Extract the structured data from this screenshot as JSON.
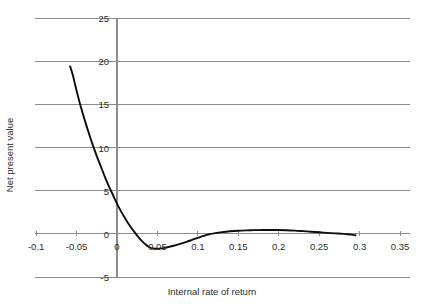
{
  "figure": {
    "top_fragment": "",
    "background": "#ffffff",
    "grid_color": "#8c8c8c",
    "axis_color": "#8c8c8c",
    "curve_color": "#0d0d0d",
    "text_color": "#2b2b2b"
  },
  "chart_data": {
    "type": "line",
    "title": "",
    "subtitle": "",
    "xlabel": "Internal rate of return",
    "ylabel": "Net present value",
    "xlim": [
      -0.1,
      0.35
    ],
    "ylim": [
      -5,
      25
    ],
    "xticks": [
      -0.1,
      -0.05,
      0,
      0.05,
      0.1,
      0.15,
      0.2,
      0.25,
      0.3,
      0.35
    ],
    "xticklabels": [
      "-0.1",
      "-0.05",
      "0",
      "0.05",
      "0.1",
      "0.15",
      "0.2",
      "0.25",
      "0.3",
      "0.35"
    ],
    "yticks": [
      -5,
      0,
      5,
      10,
      15,
      20,
      25
    ],
    "yticklabels": [
      "-5",
      "0",
      "5",
      "10",
      "15",
      "20",
      "25"
    ],
    "grid": "horizontal",
    "legend": null,
    "legend_position": "none",
    "annotations": [],
    "series": [
      {
        "name": "Net present value",
        "color": "#0d0d0d",
        "x": [
          -0.058,
          -0.055,
          -0.05,
          -0.045,
          -0.04,
          -0.035,
          -0.03,
          -0.025,
          -0.02,
          -0.015,
          -0.01,
          -0.005,
          0.0,
          0.005,
          0.01,
          0.015,
          0.02,
          0.025,
          0.03,
          0.035,
          0.04,
          0.045,
          0.05,
          0.055,
          0.06,
          0.065,
          0.07,
          0.075,
          0.08,
          0.085,
          0.09,
          0.095,
          0.1,
          0.105,
          0.11,
          0.115,
          0.12,
          0.13,
          0.14,
          0.15,
          0.16,
          0.17,
          0.18,
          0.19,
          0.2,
          0.21,
          0.22,
          0.23,
          0.24,
          0.25,
          0.26,
          0.27,
          0.28,
          0.285,
          0.29,
          0.295
        ],
        "y": [
          19.4,
          18.5,
          16.6,
          14.8,
          13.2,
          11.7,
          10.3,
          9.0,
          7.8,
          6.6,
          5.5,
          4.5,
          3.5,
          2.6,
          1.8,
          1.05,
          0.4,
          -0.2,
          -0.75,
          -1.2,
          -1.55,
          -1.7,
          -1.72,
          -1.68,
          -1.6,
          -1.5,
          -1.38,
          -1.25,
          -1.1,
          -0.95,
          -0.8,
          -0.62,
          -0.46,
          -0.3,
          -0.15,
          -0.03,
          0.06,
          0.2,
          0.3,
          0.36,
          0.4,
          0.43,
          0.45,
          0.45,
          0.44,
          0.41,
          0.37,
          0.31,
          0.25,
          0.18,
          0.11,
          0.05,
          0.0,
          -0.04,
          -0.09,
          -0.16
        ]
      }
    ]
  },
  "axes": {
    "y_axis_title": "Net present value",
    "x_axis_title": "Internal rate of return"
  }
}
